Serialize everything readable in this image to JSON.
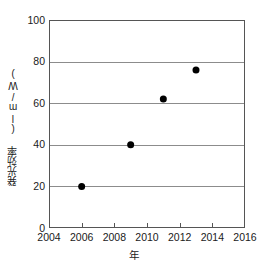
{
  "chart_data": {
    "type": "scatter",
    "title": "",
    "xlabel": "年",
    "ylabel": "発光効率 (lm/W)",
    "xlim": [
      2004,
      2016
    ],
    "ylim": [
      0,
      100
    ],
    "xticks": [
      2004,
      2006,
      2008,
      2010,
      2012,
      2014,
      2016
    ],
    "yticks": [
      0,
      20,
      40,
      60,
      80,
      100
    ],
    "xtick_labels": [
      "2004",
      "2006",
      "2008",
      "2010",
      "2012",
      "2014",
      "2016"
    ],
    "ytick_labels": [
      "0",
      "20",
      "40",
      "60",
      "80",
      "100"
    ],
    "grid": "horizontal",
    "legend": "none",
    "x": [
      2006,
      2009,
      2011,
      2013
    ],
    "values": [
      20,
      40,
      62,
      76
    ],
    "points": [
      {
        "x": 2006,
        "y": 20
      },
      {
        "x": 2009,
        "y": 40
      },
      {
        "x": 2011,
        "y": 62
      },
      {
        "x": 2013,
        "y": 76
      }
    ],
    "marker": {
      "shape": "circle",
      "filled": true,
      "color": "#000000",
      "size_px": 7
    },
    "colors": {
      "axis": "#555555",
      "grid": "#8c8c8c",
      "marker": "#000000",
      "text": "#1a1a1a",
      "background": "#ffffff"
    }
  }
}
